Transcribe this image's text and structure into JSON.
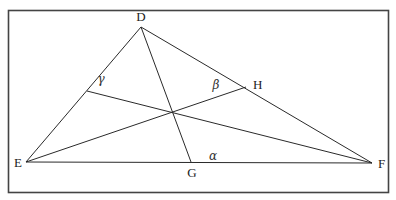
{
  "diagram": {
    "type": "triangle with three cevians",
    "vertices": [
      {
        "id": "D",
        "label": "D"
      },
      {
        "id": "E",
        "label": "E"
      },
      {
        "id": "F",
        "label": "F"
      }
    ],
    "side_points": [
      {
        "id": "G",
        "label": "G",
        "on_side": "EF"
      },
      {
        "id": "H",
        "label": "H",
        "on_side": "DF"
      }
    ],
    "angles": [
      {
        "id": "alpha",
        "label": "α"
      },
      {
        "id": "beta",
        "label": "β"
      },
      {
        "id": "gamma",
        "label": "γ"
      }
    ]
  }
}
